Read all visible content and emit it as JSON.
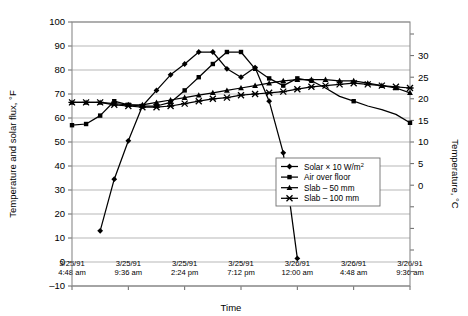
{
  "chart_data": {
    "type": "line",
    "title": "",
    "xlabel": "Time",
    "ylabel": "Temperature and solar flux, °F",
    "y2label": "Temperature, °C",
    "ylim": [
      -10,
      100
    ],
    "y2lim": [
      -23.3,
      37.8
    ],
    "yticks": [
      -10,
      0,
      10,
      20,
      30,
      40,
      50,
      60,
      70,
      80,
      90,
      100
    ],
    "yticklabels": [
      "–10",
      "0",
      "10",
      "20",
      "30",
      "40",
      "50",
      "60",
      "70",
      "80",
      "90",
      "100"
    ],
    "y2ticks": [
      0,
      5,
      10,
      15,
      20,
      25,
      30
    ],
    "y2ticklabels": [
      "0",
      "5",
      "10",
      "15",
      "20",
      "25",
      "30"
    ],
    "grid": true,
    "legend_position": "lower right",
    "x": [
      0,
      1,
      2,
      3,
      4,
      5,
      6,
      7,
      8,
      9,
      10,
      11,
      12,
      13,
      14,
      15,
      16,
      17,
      18,
      19,
      20,
      21,
      22,
      23,
      24
    ],
    "xticks": [
      0,
      4,
      8,
      12,
      16,
      20,
      24
    ],
    "xticklabels": [
      {
        "date": "3/25/91",
        "time": "4:48 am"
      },
      {
        "date": "3/25/91",
        "time": "9:36 am"
      },
      {
        "date": "3/25/91",
        "time": "2:24 pm"
      },
      {
        "date": "3/25/91",
        "time": "7:12 pm"
      },
      {
        "date": "3/26/91",
        "time": "12:00 am"
      },
      {
        "date": "3/26/91",
        "time": "4:48 am"
      },
      {
        "date": "3/26/91",
        "time": "9:36 am"
      }
    ],
    "series": [
      {
        "name": "Solar × 10 W/m²",
        "marker": "diamond",
        "x": [
          2,
          3,
          4,
          5,
          6,
          7,
          8,
          9,
          10,
          11,
          12,
          13,
          14,
          15,
          16
        ],
        "values": [
          13,
          34.5,
          50.5,
          65,
          71.5,
          78,
          82.5,
          87.5,
          87.5,
          80.5,
          77,
          81,
          67,
          45.5,
          1.5
        ]
      },
      {
        "name": "Air over floor",
        "marker": "square",
        "x": [
          0,
          1,
          2,
          3,
          4,
          5,
          6,
          7,
          8,
          9,
          10,
          11,
          12,
          13,
          14,
          15,
          16,
          17,
          18,
          19,
          20,
          21,
          22,
          23,
          24
        ],
        "values": [
          57,
          57.5,
          61,
          67,
          65.5,
          65,
          65,
          66.5,
          71.5,
          77,
          82.5,
          87.5,
          87.5,
          80.5,
          76.5,
          73.5,
          76.5,
          75.5,
          72.5,
          69,
          67,
          65,
          63.5,
          61.5,
          58
        ],
        "visible_points": [
          0,
          1,
          2,
          3,
          4,
          5,
          6,
          7,
          8,
          9,
          10,
          11,
          12,
          13,
          14,
          15,
          16,
          17,
          20,
          24
        ]
      },
      {
        "name": "Slab – 50 mm",
        "marker": "triangle",
        "x": [
          0,
          1,
          2,
          3,
          4,
          5,
          6,
          7,
          8,
          9,
          10,
          11,
          12,
          13,
          14,
          15,
          16,
          17,
          18,
          19,
          20,
          21,
          22,
          23,
          24
        ],
        "values": [
          66.5,
          66.5,
          66.5,
          66,
          65.5,
          65.5,
          66.5,
          67.5,
          68.5,
          69.5,
          70.5,
          71.5,
          72.5,
          73.5,
          74.5,
          75.5,
          76,
          76,
          76,
          75.5,
          75.5,
          74.5,
          73.5,
          72.5,
          70.5
        ]
      },
      {
        "name": "Slab – 100 mm",
        "marker": "x-bar",
        "x": [
          0,
          1,
          2,
          3,
          4,
          5,
          6,
          7,
          8,
          9,
          10,
          11,
          12,
          13,
          14,
          15,
          16,
          17,
          18,
          19,
          20,
          21,
          22,
          23,
          24
        ],
        "values": [
          66.5,
          66.5,
          66.5,
          65.5,
          65,
          64.5,
          64.5,
          65,
          66,
          67,
          68,
          68.5,
          69.5,
          70,
          70.5,
          71,
          72,
          73,
          73.5,
          74,
          74.5,
          74,
          73.5,
          73,
          72.5
        ]
      }
    ]
  },
  "legend": {
    "items": [
      {
        "label_main": "Solar × 10 W/m",
        "label_sup": "2",
        "marker": "diamond"
      },
      {
        "label_main": "Air over floor",
        "label_sup": "",
        "marker": "square"
      },
      {
        "label_main": "Slab – 50 mm",
        "label_sup": "",
        "marker": "triangle"
      },
      {
        "label_main": "Slab – 100 mm",
        "label_sup": "",
        "marker": "x-bar"
      }
    ]
  }
}
